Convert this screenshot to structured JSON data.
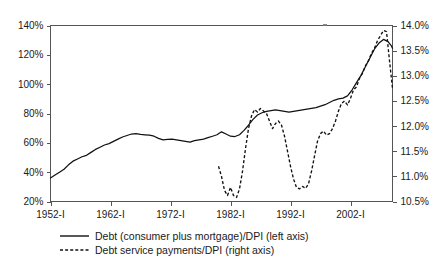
{
  "chart_data": {
    "type": "line",
    "title": "",
    "subtitle": "",
    "xlabel": "",
    "ylabel": "",
    "grid": false,
    "legend_position": "bottom-left",
    "x_tick_labels": [
      "1952-I",
      "1962-I",
      "1972-I",
      "1982-I",
      "1992-I",
      "2002-I"
    ],
    "x_tick_values": [
      1952,
      1962,
      1972,
      1982,
      1992,
      2002
    ],
    "xlim": [
      1952,
      2009
    ],
    "left_axis": {
      "label": "",
      "ylim": [
        20,
        140
      ],
      "tick_labels": [
        "20%",
        "40%",
        "60%",
        "80%",
        "100%",
        "120%",
        "140%"
      ],
      "tick_values": [
        20,
        40,
        60,
        80,
        100,
        120,
        140
      ],
      "unit": "%"
    },
    "right_axis": {
      "label": "",
      "ylim": [
        10.5,
        14.0
      ],
      "tick_labels": [
        "10.5%",
        "11.0%",
        "11.5%",
        "12.0%",
        "12.5%",
        "13.0%",
        "13.5%",
        "14.0%"
      ],
      "tick_values": [
        10.5,
        11.0,
        11.5,
        12.0,
        12.5,
        13.0,
        13.5,
        14.0
      ],
      "unit": "%"
    },
    "series": [
      {
        "name": "Debt (consumer plus mortgage)/DPI (left axis)",
        "axis": "left",
        "style": "solid",
        "color": "#111111",
        "x": [
          1952.0,
          1952.75,
          1953.5,
          1954.25,
          1955.0,
          1955.75,
          1956.5,
          1957.25,
          1958.0,
          1958.75,
          1959.5,
          1960.25,
          1961.0,
          1961.75,
          1962.5,
          1963.25,
          1964.0,
          1964.75,
          1965.5,
          1966.25,
          1967.0,
          1967.75,
          1968.5,
          1969.25,
          1970.0,
          1970.75,
          1971.5,
          1972.25,
          1973.0,
          1973.75,
          1974.5,
          1975.25,
          1976.0,
          1976.75,
          1977.5,
          1978.25,
          1979.0,
          1979.75,
          1980.5,
          1981.25,
          1982.0,
          1982.75,
          1983.5,
          1984.25,
          1985.0,
          1985.75,
          1986.5,
          1987.25,
          1988.0,
          1988.75,
          1989.5,
          1990.25,
          1991.0,
          1991.75,
          1992.5,
          1993.25,
          1994.0,
          1994.75,
          1995.5,
          1996.25,
          1997.0,
          1997.75,
          1998.5,
          1999.25,
          2000.0,
          2000.75,
          2001.5,
          2002.25,
          2003.0,
          2003.75,
          2004.5,
          2005.25,
          2006.0,
          2006.75,
          2007.5,
          2008.25,
          2008.75,
          2009.0
        ],
        "values": [
          36.0,
          38.0,
          40.0,
          42.0,
          45.0,
          47.5,
          49.0,
          50.5,
          51.5,
          53.5,
          55.5,
          57.0,
          58.5,
          59.5,
          61.0,
          62.5,
          64.0,
          65.0,
          66.0,
          66.3,
          65.8,
          65.5,
          65.2,
          64.5,
          63.0,
          62.0,
          62.3,
          62.5,
          62.0,
          61.5,
          61.0,
          60.5,
          61.5,
          62.0,
          62.5,
          63.5,
          64.5,
          65.5,
          67.5,
          66.0,
          64.5,
          64.3,
          65.5,
          68.5,
          72.0,
          76.0,
          79.0,
          80.5,
          81.5,
          82.0,
          82.5,
          82.0,
          81.5,
          81.0,
          81.5,
          82.0,
          82.5,
          83.0,
          83.5,
          84.0,
          85.0,
          86.0,
          87.5,
          89.0,
          90.0,
          90.5,
          92.0,
          96.0,
          101.0,
          106.0,
          112.0,
          118.0,
          124.0,
          128.0,
          130.5,
          129.0,
          126.5,
          124.5
        ]
      },
      {
        "name": "Debt service payments/DPI (right axis)",
        "axis": "right",
        "style": "dashed",
        "color": "#111111",
        "x": [
          1980.0,
          1980.5,
          1981.0,
          1981.5,
          1982.0,
          1982.5,
          1983.0,
          1983.5,
          1984.0,
          1984.5,
          1985.0,
          1985.5,
          1986.0,
          1986.5,
          1987.0,
          1987.5,
          1988.0,
          1988.5,
          1989.0,
          1989.5,
          1990.0,
          1990.5,
          1991.0,
          1991.5,
          1992.0,
          1992.5,
          1993.0,
          1993.5,
          1994.0,
          1994.5,
          1995.0,
          1995.5,
          1996.0,
          1996.5,
          1997.0,
          1997.5,
          1998.0,
          1998.5,
          1999.0,
          1999.5,
          2000.0,
          2000.5,
          2001.0,
          2001.5,
          2002.0,
          2002.5,
          2003.0,
          2003.5,
          2004.0,
          2004.5,
          2005.0,
          2005.5,
          2006.0,
          2006.5,
          2007.0,
          2007.5,
          2008.0,
          2008.5,
          2009.0
        ],
        "values": [
          11.2,
          11.0,
          10.72,
          10.62,
          10.78,
          10.62,
          10.58,
          10.75,
          11.1,
          11.55,
          11.95,
          12.2,
          12.33,
          12.28,
          12.35,
          12.3,
          12.25,
          12.1,
          11.95,
          12.05,
          12.1,
          12.02,
          11.8,
          11.5,
          11.2,
          10.95,
          10.78,
          10.75,
          10.8,
          10.76,
          10.85,
          11.1,
          11.4,
          11.7,
          11.85,
          11.9,
          11.82,
          11.85,
          11.95,
          12.1,
          12.3,
          12.45,
          12.5,
          12.42,
          12.55,
          12.72,
          12.78,
          12.95,
          13.05,
          13.2,
          13.3,
          13.45,
          13.55,
          13.7,
          13.8,
          13.9,
          13.88,
          13.3,
          12.75
        ]
      }
    ],
    "legend": [
      {
        "label": "Debt (consumer plus mortgage)/DPI (left axis)",
        "style": "solid"
      },
      {
        "label": "Debt service payments/DPI (right axis)",
        "style": "dashed"
      }
    ]
  }
}
